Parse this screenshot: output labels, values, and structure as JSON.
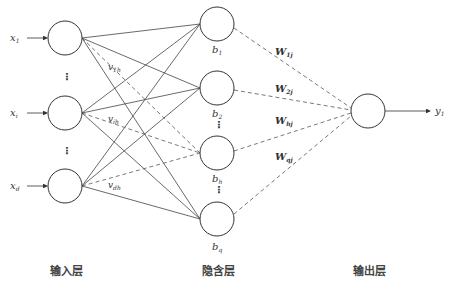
{
  "diagram": {
    "type": "neural-network",
    "layers": {
      "input": {
        "title": "输入层",
        "nodes": [
          {
            "id": "x1",
            "label": "x",
            "sub": "1",
            "cx": 65,
            "cy": 38
          },
          {
            "id": "xi",
            "label": "x",
            "sub": "i",
            "cx": 65,
            "cy": 113
          },
          {
            "id": "xd",
            "label": "x",
            "sub": "d",
            "cx": 65,
            "cy": 186
          }
        ]
      },
      "hidden": {
        "title": "隐含层",
        "nodes": [
          {
            "id": "b1",
            "label": "b",
            "sub": "1",
            "cx": 217,
            "cy": 24
          },
          {
            "id": "b2",
            "label": "b",
            "sub": "2",
            "cx": 217,
            "cy": 88
          },
          {
            "id": "bh",
            "label": "b",
            "sub": "h",
            "cx": 217,
            "cy": 153
          },
          {
            "id": "bq",
            "label": "b",
            "sub": "q",
            "cx": 217,
            "cy": 219
          }
        ]
      },
      "output": {
        "title": "输出层",
        "nodes": [
          {
            "id": "y1",
            "label": "y",
            "sub": "1",
            "cx": 368,
            "cy": 111
          }
        ]
      }
    },
    "input_weight_labels": [
      {
        "label": "v",
        "sub": "1h",
        "x": 108,
        "y": 70
      },
      {
        "label": "v",
        "sub": "ih",
        "x": 108,
        "y": 122
      },
      {
        "label": "v",
        "sub": "dh",
        "x": 108,
        "y": 188
      }
    ],
    "output_weight_labels": [
      {
        "label": "W",
        "sub": "1j",
        "x": 275,
        "y": 55
      },
      {
        "label": "W",
        "sub": "2j",
        "x": 275,
        "y": 92
      },
      {
        "label": "W",
        "sub": "hj",
        "x": 275,
        "y": 124
      },
      {
        "label": "W",
        "sub": "qj",
        "x": 275,
        "y": 160
      }
    ],
    "ellipsis": "⋮",
    "node_radius": 17,
    "colors": {
      "line": "#444444",
      "dashed": "#666666",
      "node_stroke": "#333333"
    }
  }
}
